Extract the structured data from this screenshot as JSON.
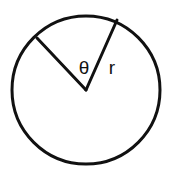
{
  "figure": {
    "name": "circle-sector-diagram",
    "background_color": "#ffffff",
    "stroke_color": "#111111",
    "text_color": "#111111",
    "canvas": {
      "width": 174,
      "height": 183
    },
    "circle": {
      "center_x": 86,
      "center_y": 90,
      "radius": 74,
      "stroke_width": 3
    },
    "radii": [
      {
        "name": "left-radius",
        "from_x": 86,
        "from_y": 90,
        "to_x": 37,
        "to_y": 38,
        "stroke_width": 3
      },
      {
        "name": "right-radius",
        "from_x": 86,
        "from_y": 90,
        "to_x": 117,
        "to_y": 20,
        "stroke_width": 3
      }
    ],
    "labels": {
      "angle": {
        "text": "θ",
        "x": 84,
        "y": 69,
        "font_size": 19
      },
      "radius": {
        "text": "r",
        "x": 112,
        "y": 69,
        "font_size": 19
      }
    }
  }
}
